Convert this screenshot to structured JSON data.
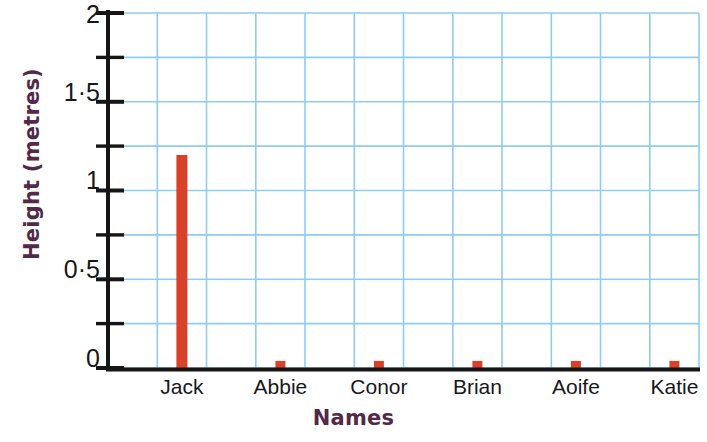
{
  "chart_data": {
    "type": "bar",
    "title": "",
    "subtitle": "",
    "xlabel": "Names",
    "ylabel": "Height (metres)",
    "categories": [
      "Jack",
      "Abbie",
      "Conor",
      "Brian",
      "Aoife",
      "Katie"
    ],
    "values": [
      1.2,
      0.04,
      0.04,
      0.04,
      0.04,
      0.04
    ],
    "series": [
      {
        "name": "Height",
        "values": [
          1.2,
          0.04,
          0.04,
          0.04,
          0.04,
          0.04
        ]
      }
    ],
    "ylim": [
      0,
      2
    ],
    "y_ticks": [
      0,
      0.25,
      0.5,
      0.75,
      1,
      1.25,
      1.5,
      1.75,
      2
    ],
    "y_tick_labels": [
      "0",
      "",
      "0·0·5",
      "",
      "1",
      "",
      "1·5",
      "",
      "2"
    ],
    "y_major_labelled": [
      "0",
      "0·5",
      "1",
      "1·5",
      "2"
    ],
    "y_major_values": [
      0,
      0.5,
      1,
      1.5,
      2
    ],
    "grid": true,
    "grid_color": "#8fcdf0",
    "grid_y_step": 0.25,
    "grid_x_columns": 12,
    "legend": "none",
    "bar_color": "#d8412a",
    "axis_color": "#161616",
    "title_color": "#53294a",
    "tick_label_color": "#17171c",
    "background": "#ffffff"
  },
  "axis": {
    "y_title": "Height (metres)",
    "x_title": "Names"
  },
  "y_ticks": [
    {
      "label": "2",
      "value": 2
    },
    {
      "label": "1·5",
      "value": 1.5
    },
    {
      "label": "1",
      "value": 1
    },
    {
      "label": "0·5",
      "value": 0.5
    },
    {
      "label": "0",
      "value": 0
    }
  ],
  "x_ticks": [
    {
      "label": "Jack"
    },
    {
      "label": "Abbie"
    },
    {
      "label": "Conor"
    },
    {
      "label": "Brian"
    },
    {
      "label": "Aoife"
    },
    {
      "label": "Katie"
    }
  ],
  "bars": [
    {
      "name": "Jack",
      "value": 1.2
    },
    {
      "name": "Abbie",
      "value": 0.04
    },
    {
      "name": "Conor",
      "value": 0.04
    },
    {
      "name": "Brian",
      "value": 0.04
    },
    {
      "name": "Aoife",
      "value": 0.04
    },
    {
      "name": "Katie",
      "value": 0.04
    }
  ]
}
